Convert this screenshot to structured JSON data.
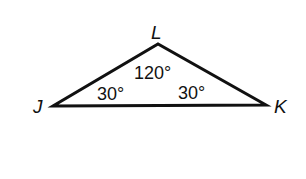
{
  "diagram": {
    "type": "triangle",
    "stroke_color": "#111111",
    "background": "#ffffff",
    "vertices": [
      {
        "name": "J",
        "x": 53,
        "y": 106
      },
      {
        "name": "K",
        "x": 266,
        "y": 105
      },
      {
        "name": "L",
        "x": 158,
        "y": 44
      }
    ],
    "vertex_labels": {
      "J": "J",
      "K": "K",
      "L": "L"
    },
    "angles": {
      "L": "120°",
      "J": "30°",
      "K": "30°"
    }
  }
}
